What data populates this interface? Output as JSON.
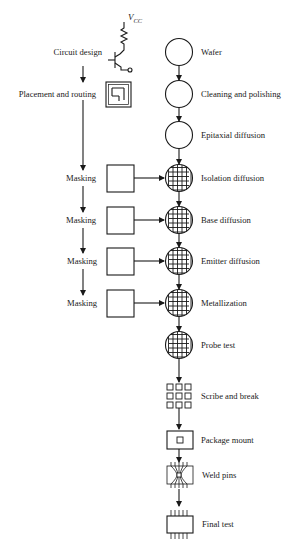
{
  "diagram": {
    "type": "process-flowchart",
    "design_steps": [
      {
        "label": "Circuit design",
        "icon": "transistor-schematic-icon"
      },
      {
        "label": "Placement and routing",
        "icon": "layout-routing-icon"
      }
    ],
    "vcc_label": "V",
    "vcc_sub": "CC",
    "masking_label": "Masking",
    "masking_steps": [
      "Masking",
      "Masking",
      "Masking",
      "Masking"
    ],
    "process_steps": [
      {
        "label": "Wafer",
        "shape": "circle-plain"
      },
      {
        "label": "Cleaning and polishing",
        "shape": "circle-plain"
      },
      {
        "label": "Epitaxial diffusion",
        "shape": "circle-plain"
      },
      {
        "label": "Isolation diffusion",
        "shape": "circle-grid"
      },
      {
        "label": "Base diffusion",
        "shape": "circle-grid"
      },
      {
        "label": "Emitter diffusion",
        "shape": "circle-grid"
      },
      {
        "label": "Metallization",
        "shape": "circle-grid"
      },
      {
        "label": "Probe test",
        "shape": "circle-grid"
      },
      {
        "label": "Scribe and break",
        "shape": "die-grid-3x3"
      },
      {
        "label": "Package mount",
        "shape": "package-box"
      },
      {
        "label": "Weld pins",
        "shape": "bonded-package"
      },
      {
        "label": "Final test",
        "shape": "dip-chip"
      }
    ],
    "colors": {
      "stroke": "#1a1a1a",
      "background": "#ffffff"
    }
  }
}
